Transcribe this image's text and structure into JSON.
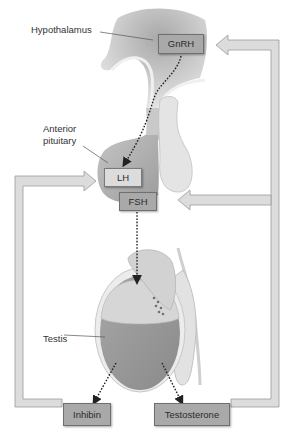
{
  "diagram": {
    "type": "hormonal-feedback-loop",
    "labels": {
      "hypothalamus": "Hypothalamus",
      "anterior_pituitary_line1": "Anterior",
      "anterior_pituitary_line2": "pituitary",
      "testis": "Testis"
    },
    "hormones": {
      "gnrh": "GnRH",
      "lh": "LH",
      "fsh": "FSH",
      "inhibin": "Inhibin",
      "testosterone": "Testosterone"
    },
    "colors": {
      "hormone_box": "#a9a9a9",
      "lh_box": "#dcdcdc",
      "feedback_arrow": "#d8d8d8",
      "tissue": "#bdbdbd",
      "stimulation_arrow": "#222222"
    },
    "connections": [
      {
        "from": "GnRH",
        "to": "LH",
        "style": "dotted"
      },
      {
        "from": "FSH",
        "to": "Testis",
        "style": "dotted"
      },
      {
        "from": "Testis",
        "to": "Inhibin",
        "style": "dotted"
      },
      {
        "from": "Testis",
        "to": "Testosterone",
        "style": "dotted"
      },
      {
        "from": "Inhibin",
        "to": "LH",
        "style": "feedback"
      },
      {
        "from": "Testosterone",
        "to": "FSH",
        "style": "feedback"
      },
      {
        "from": "Testosterone",
        "to": "GnRH",
        "style": "feedback"
      }
    ]
  }
}
